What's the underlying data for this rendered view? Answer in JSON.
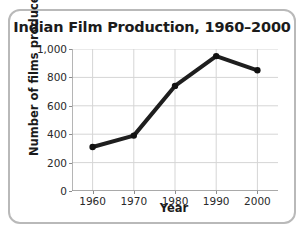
{
  "chart_data": {
    "type": "line",
    "title": "Indian Film Production, 1960–2000",
    "xlabel": "Year",
    "ylabel": "Number of films produced",
    "categories": [
      1960,
      1970,
      1980,
      1990,
      2000
    ],
    "x_tick_labels": [
      "1960",
      "1970",
      "1980",
      "1990",
      "2000"
    ],
    "values": [
      310,
      390,
      740,
      950,
      850
    ],
    "y_ticks": [
      0,
      200,
      400,
      600,
      800,
      1000
    ],
    "y_tick_labels": [
      "0",
      "200",
      "400",
      "600",
      "800",
      "1,000"
    ],
    "ylim": [
      0,
      1000
    ],
    "xlim": [
      1955,
      2005
    ],
    "grid": "both",
    "legend": "none",
    "series": [
      {
        "name": "Number of films produced",
        "values": [
          310,
          390,
          740,
          950,
          850
        ],
        "color": "#1e1e1e",
        "marker": "circle",
        "line_width": 4
      }
    ],
    "colors": {
      "line": "#1e1e1e",
      "marker": "#111111",
      "grid": "#d5d5d5",
      "axis": "#8d8d8d",
      "text": "#1b1b1b",
      "frame": "#b9b9b9",
      "background": "#ffffff"
    }
  }
}
